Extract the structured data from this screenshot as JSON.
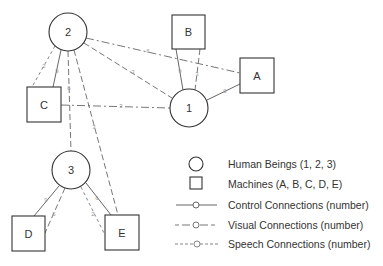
{
  "humans": [
    {
      "id": "1",
      "label": "1",
      "cx": 189,
      "cy": 108,
      "r": 19
    },
    {
      "id": "2",
      "label": "2",
      "cx": 68,
      "cy": 32,
      "r": 19
    },
    {
      "id": "3",
      "label": "3",
      "cx": 71,
      "cy": 170,
      "r": 19
    }
  ],
  "machines": [
    {
      "id": "A",
      "label": "A",
      "x": 240,
      "y": 58,
      "w": 34,
      "h": 35
    },
    {
      "id": "B",
      "label": "B",
      "x": 172,
      "y": 15,
      "w": 33,
      "h": 34
    },
    {
      "id": "C",
      "label": "C",
      "x": 27,
      "y": 87,
      "w": 34,
      "h": 35
    },
    {
      "id": "D",
      "label": "D",
      "x": 12,
      "y": 216,
      "w": 33,
      "h": 35
    },
    {
      "id": "E",
      "label": "E",
      "x": 105,
      "y": 215,
      "w": 34,
      "h": 35
    }
  ],
  "connections": [
    {
      "from": "2",
      "to": "A",
      "type": "visual",
      "label": "6"
    },
    {
      "from": "2",
      "to": "1",
      "type": "visual",
      "label": "3"
    },
    {
      "from": "2",
      "to": "C",
      "type": "speech",
      "label": "2"
    },
    {
      "from": "2",
      "to": "C",
      "type": "control",
      "label": "9"
    },
    {
      "from": "2",
      "to": "3",
      "type": "visual",
      "label": "6"
    },
    {
      "from": "2",
      "to": "E",
      "type": "visual",
      "label": "3"
    },
    {
      "from": "C",
      "to": "1",
      "type": "visual",
      "label": "3"
    },
    {
      "from": "B",
      "to": "1",
      "type": "control",
      "label": "9"
    },
    {
      "from": "B",
      "to": "1",
      "type": "visual",
      "label": "3"
    },
    {
      "from": "1",
      "to": "A",
      "type": "control",
      "label": "9"
    },
    {
      "from": "3",
      "to": "D",
      "type": "control",
      "label": "9"
    },
    {
      "from": "3",
      "to": "D",
      "type": "visual",
      "label": "6"
    },
    {
      "from": "3",
      "to": "E",
      "type": "control",
      "label": "6"
    },
    {
      "from": "3",
      "to": "E",
      "type": "speech",
      "label": "2"
    }
  ],
  "legend": {
    "items": [
      {
        "symbol": "circle",
        "text": "Human Beings (1, 2, 3)"
      },
      {
        "symbol": "square",
        "text": "Machines (A, B, C, D, E)"
      },
      {
        "symbol": "control-line",
        "text": "Control Connections (number)"
      },
      {
        "symbol": "visual-line",
        "text": "Visual Connections (number)"
      },
      {
        "symbol": "speech-line",
        "text": "Speech Connections (number)"
      }
    ]
  }
}
